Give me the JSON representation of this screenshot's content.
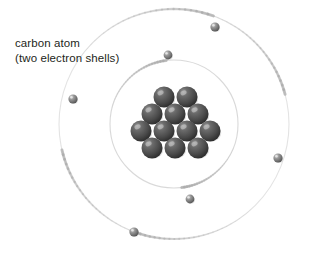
{
  "figure": {
    "title": "carbon atom",
    "subtitle": "(two electron shells)",
    "background_color": "#ffffff",
    "caption_color": "#231f20"
  },
  "nucleus": {
    "label": "nucleus",
    "particle_count": 12,
    "particle_color": "#4a4a4a",
    "particle_highlight_color": "#9a9a9a",
    "particle_shadow_color": "#242424",
    "particle_radius": 10.5,
    "center": {
      "x": 174,
      "y": 124
    },
    "rows": [
      {
        "count": 2,
        "y": 97,
        "xs": [
          164,
          187
        ]
      },
      {
        "count": 3,
        "y": 114,
        "xs": [
          152,
          175,
          198
        ]
      },
      {
        "count": 4,
        "y": 131,
        "xs": [
          141,
          164,
          187,
          210
        ]
      },
      {
        "count": 3,
        "y": 148,
        "xs": [
          152,
          175,
          198
        ]
      }
    ]
  },
  "shells": [
    {
      "name": "inner-shell",
      "label": "inner electron shell",
      "center": {
        "x": 174,
        "y": 124
      },
      "radius": 64,
      "stroke_color": "#d2d2d2",
      "stroke_width": 1.1,
      "electron_count": 2
    },
    {
      "name": "outer-shell",
      "label": "outer electron shell",
      "center": {
        "x": 174,
        "y": 124
      },
      "radius": 115,
      "stroke_color": "#dedede",
      "stroke_width": 1.1,
      "electron_count": 4
    }
  ],
  "electrons": [
    {
      "name": "electron-outer-top-right",
      "shell": "outer-shell",
      "x": 215,
      "y": 27,
      "radius": 4.6,
      "tail_start_angle_deg": 215,
      "tail_end_angle_deg": 290,
      "color": "#6f6f6f"
    },
    {
      "name": "electron-inner-upper-left",
      "shell": "inner-shell",
      "x": 168,
      "y": 55,
      "radius": 4.4,
      "tail_start_angle_deg": 195,
      "tail_end_angle_deg": 263,
      "color": "#6f6f6f"
    },
    {
      "name": "electron-outer-left",
      "shell": "outer-shell",
      "x": 73,
      "y": 99,
      "radius": 4.6,
      "tail_start_angle_deg": 103,
      "tail_end_angle_deg": 167,
      "color": "#6f6f6f"
    },
    {
      "name": "electron-outer-right",
      "shell": "outer-shell",
      "x": 278,
      "y": 158,
      "radius": 4.6,
      "tail_start_angle_deg": 283,
      "tail_end_angle_deg": 345,
      "color": "#6f6f6f"
    },
    {
      "name": "electron-inner-lower",
      "shell": "inner-shell",
      "x": 190,
      "y": 199,
      "radius": 4.4,
      "tail_start_angle_deg": 22,
      "tail_end_angle_deg": 83,
      "color": "#6f6f6f"
    },
    {
      "name": "electron-outer-bottom-left",
      "shell": "outer-shell",
      "x": 134,
      "y": 232,
      "radius": 4.6,
      "tail_start_angle_deg": 48,
      "tail_end_angle_deg": 112,
      "color": "#6f6f6f"
    }
  ]
}
